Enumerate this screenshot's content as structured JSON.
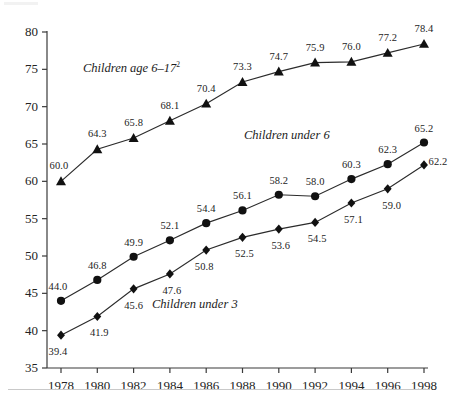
{
  "chart_data": {
    "type": "line",
    "title": "",
    "subtitle": "",
    "xlabel": "",
    "ylabel": "",
    "x": [
      1978,
      1980,
      1982,
      1984,
      1986,
      1988,
      1990,
      1992,
      1994,
      1996,
      1998
    ],
    "categories": [
      "1978",
      "1980",
      "1982",
      "1984",
      "1986",
      "1988",
      "1990",
      "1992",
      "1994",
      "1996",
      "1998"
    ],
    "xlim": [
      1977,
      1999
    ],
    "ylim": [
      35,
      80
    ],
    "yticks": [
      35,
      40,
      45,
      50,
      55,
      60,
      65,
      70,
      75,
      80
    ],
    "yticklabels": [
      "35",
      "40",
      "45",
      "50",
      "55",
      "60",
      "65",
      "70",
      "75",
      "80"
    ],
    "grid": false,
    "legend": "inline-annotations",
    "series": [
      {
        "name": "Children age 6–17²",
        "label_html": "Children age 6–17<sup>2</sup>",
        "marker": "triangle",
        "color": "#111111",
        "values": [
          60.0,
          64.3,
          65.8,
          68.1,
          70.4,
          73.3,
          74.7,
          75.9,
          76.0,
          77.2,
          78.4
        ],
        "value_labels": [
          "60.0",
          "64.3",
          "65.8",
          "68.1",
          "70.4",
          "73.3",
          "74.7",
          "75.9",
          "76.0",
          "77.2",
          "78.4"
        ]
      },
      {
        "name": "Children under 6",
        "label_html": "Children under 6",
        "marker": "circle",
        "color": "#111111",
        "values": [
          44.0,
          46.8,
          49.9,
          52.1,
          54.4,
          56.1,
          58.2,
          58.0,
          60.3,
          62.3,
          65.2
        ],
        "value_labels": [
          "44.0",
          "46.8",
          "49.9",
          "52.1",
          "54.4",
          "56.1",
          "58.2",
          "58.0",
          "60.3",
          "62.3",
          "65.2"
        ]
      },
      {
        "name": "Children under 3",
        "label_html": "Children under 3",
        "marker": "diamond",
        "color": "#111111",
        "values": [
          39.4,
          41.9,
          45.6,
          47.6,
          50.8,
          52.5,
          53.6,
          54.5,
          57.1,
          59.0,
          62.2
        ],
        "value_labels": [
          "39.4",
          "41.9",
          "45.6",
          "47.6",
          "50.8",
          "52.5",
          "53.6",
          "54.5",
          "57.1",
          "59.0",
          "62.2"
        ]
      }
    ],
    "annotations": [
      {
        "text": "Children age 6–17²",
        "series": "Children age 6–17²"
      },
      {
        "text": "Children under 6",
        "series": "Children under 6"
      },
      {
        "text": "Children under 3",
        "series": "Children under 3"
      }
    ]
  }
}
